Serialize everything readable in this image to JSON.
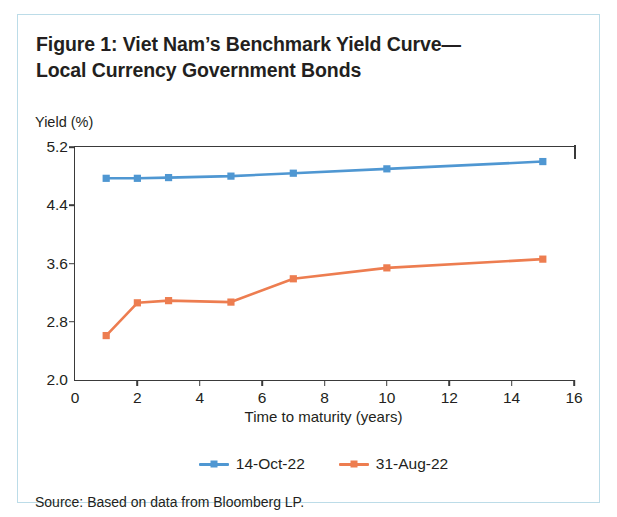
{
  "figure": {
    "title_line1": "Figure 1: Viet Nam’s Benchmark Yield Curve—",
    "title_line2": "Local Currency Government Bonds",
    "source_note": "Source: Based on data from Bloomberg LP."
  },
  "colors": {
    "series_14oct22": "#4F97D2",
    "series_31aug22": "#ED7D50",
    "axis": "#3a3a3a",
    "card_border": "#bcdce8",
    "text": "#231f20"
  },
  "chart_data": {
    "type": "line",
    "xlabel": "Time to maturity (years)",
    "ylabel": "Yield (%)",
    "xlim": [
      0,
      16
    ],
    "ylim": [
      2.0,
      5.2
    ],
    "xticks": [
      0,
      2,
      4,
      6,
      8,
      10,
      12,
      14,
      16
    ],
    "xtick_labels": [
      "0",
      "2",
      "4",
      "6",
      "8",
      "10",
      "12",
      "14",
      "16"
    ],
    "yticks": [
      2.0,
      2.8,
      3.6,
      4.4,
      5.2
    ],
    "ytick_labels": [
      "2.0",
      "2.8",
      "3.6",
      "4.4",
      "5.2"
    ],
    "grid": false,
    "legend_position": "bottom-center",
    "marker": "square",
    "x": [
      1,
      2,
      3,
      5,
      7,
      10,
      15
    ],
    "series": [
      {
        "name": "14-Oct-22",
        "color": "#4F97D2",
        "values": [
          4.77,
          4.77,
          4.78,
          4.8,
          4.84,
          4.9,
          5.0
        ]
      },
      {
        "name": "31-Aug-22",
        "color": "#ED7D50",
        "values": [
          2.61,
          3.06,
          3.09,
          3.07,
          3.39,
          3.54,
          3.66
        ]
      }
    ]
  }
}
